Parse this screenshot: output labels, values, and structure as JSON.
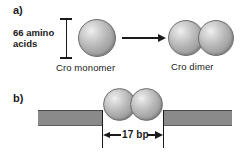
{
  "figure": {
    "panel_a": {
      "label": "a)",
      "bracket_label_line1": "66 amino",
      "bracket_label_line2": "acids",
      "monomer_caption": "Cro monomer",
      "dimer_caption": "Cro dimer",
      "arrow": "rightwards-arrow"
    },
    "panel_b": {
      "label": "b)",
      "measurement_label": "17 bp",
      "dna_element": "dna-duplex-bar",
      "bound_complex": "cro-dimer-bound-to-dna"
    },
    "colors": {
      "ink": "#1a1a1a",
      "dna_bar": "#8a8a8a",
      "dna_bar_edge": "#4a4a4a",
      "sphere_highlight": "#f2f2f2",
      "sphere_shadow": "#8e8e8e",
      "background": "#ffffff"
    }
  }
}
